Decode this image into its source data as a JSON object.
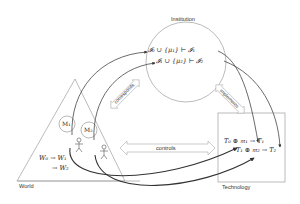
{
  "nodes": {
    "institution": {
      "label": "Institution"
    },
    "world": {
      "label": "World"
    },
    "technology": {
      "label": "Technology"
    }
  },
  "institution_formulas": [
    "𝓘₀ ∪ {μ₁} ⊢ 𝓘₁",
    "𝓘₁ ∪ {μ₂} ⊢ 𝓘₂"
  ],
  "world_formulas": [
    "W₀ → W₁",
    "→ W₂"
  ],
  "technology_formulas": [
    "T₀ ⊕ 𝔪₁ → T₁",
    "T₁ ⊕ 𝔪₂ → T₂"
  ],
  "mental_models": [
    {
      "label": "M₁"
    },
    {
      "label": "M₂"
    }
  ],
  "relations": {
    "corresponds": "corresponds",
    "implements": "implements",
    "controls": "controls"
  },
  "colors": {
    "line": "#999999",
    "arrow": "#333333",
    "text": "#333333"
  }
}
